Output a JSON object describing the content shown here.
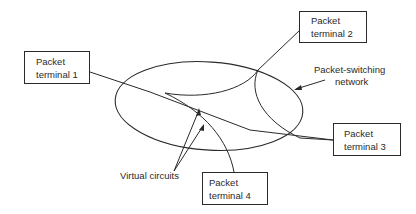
{
  "diagram": {
    "type": "network-diagram",
    "terminals": [
      {
        "id": 1,
        "line1": "Packet",
        "line2": "terminal 1"
      },
      {
        "id": 2,
        "line1": "Packet",
        "line2": "terminal 2"
      },
      {
        "id": 3,
        "line1": "Packet",
        "line2": "terminal 3"
      },
      {
        "id": 4,
        "line1": "Packet",
        "line2": "terminal 4"
      }
    ],
    "network_label": {
      "line1": "Packet-switching",
      "line2": "network"
    },
    "circuits_label": "Virtual circuits",
    "colors": {
      "stroke": "#2a2a2a",
      "background": "#ffffff"
    }
  }
}
